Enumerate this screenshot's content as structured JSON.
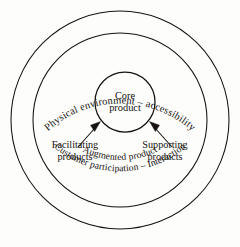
{
  "diagram": {
    "background_color": "#fdfdfb",
    "stroke_color": "#15120f",
    "core": {
      "label_line1": "Core",
      "label_line2": "product"
    },
    "rings": {
      "outer_label_top": "Physical environment – accessibility",
      "outer_label_bottom": "Customer participation – Interaction",
      "middle_label_bottom": "Augmented product"
    },
    "callouts": [
      {
        "id": "facilitating",
        "label_line1": "Facilitating",
        "label_line2": "products"
      },
      {
        "id": "supporting",
        "label_line1": "Supporting",
        "label_line2": "products"
      }
    ]
  }
}
